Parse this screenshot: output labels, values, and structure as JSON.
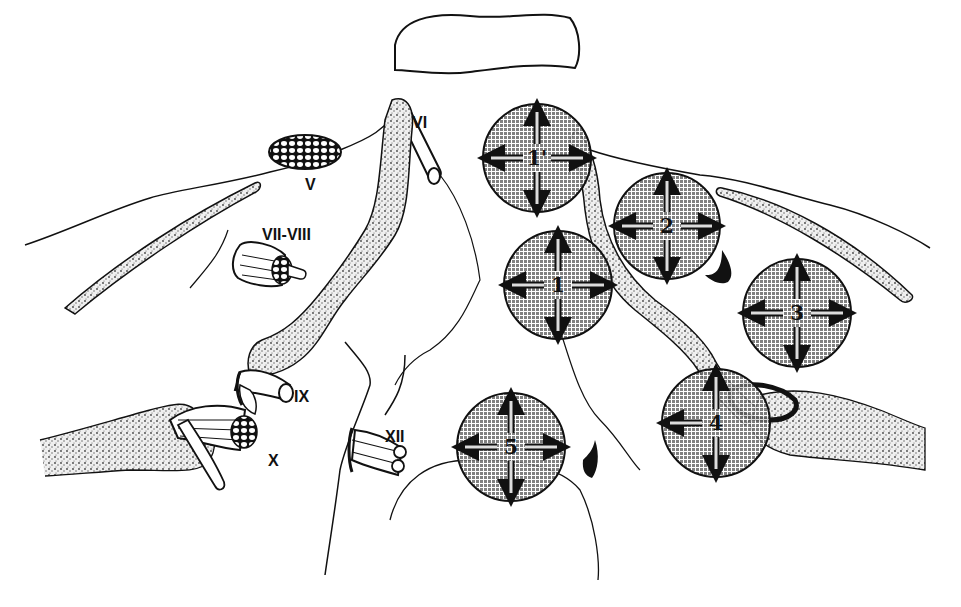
{
  "figure": {
    "type": "anatomical-illustration",
    "colors": {
      "ink": "#111111",
      "background": "#ffffff",
      "zone_fill": "#8a8a8a",
      "stipple": "#555555"
    }
  },
  "nerve_labels": {
    "v": "V",
    "vi": "VI",
    "vii_viii": "VII-VIII",
    "ix": "IX",
    "x": "X",
    "xii": "XII"
  },
  "zones": [
    {
      "id": "zone-1-prime",
      "label": "1'",
      "arrows": [
        "up",
        "down",
        "left",
        "right"
      ]
    },
    {
      "id": "zone-1",
      "label": "1",
      "arrows": [
        "up",
        "down",
        "left",
        "right"
      ]
    },
    {
      "id": "zone-2",
      "label": "2",
      "arrows": [
        "up",
        "down",
        "left",
        "right"
      ]
    },
    {
      "id": "zone-3",
      "label": "3",
      "arrows": [
        "up",
        "down",
        "left",
        "right"
      ]
    },
    {
      "id": "zone-4",
      "label": "4",
      "arrows": [
        "up",
        "down",
        "left"
      ]
    },
    {
      "id": "zone-5",
      "label": "5",
      "arrows": [
        "up",
        "down",
        "left",
        "right"
      ]
    }
  ]
}
